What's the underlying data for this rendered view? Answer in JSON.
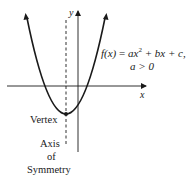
{
  "diagram": {
    "formula": {
      "lhs": "f(x)",
      "equals": " = ",
      "a_term": "ax",
      "exponent": "2",
      "rest": " + bx + c,",
      "condition": "a > 0"
    },
    "axes": {
      "x_label": "x",
      "y_label": "y"
    },
    "labels": {
      "vertex": "Vertex",
      "axis_line1": "Axis",
      "axis_line2": "of",
      "axis_line3": "Symmetry"
    },
    "colors": {
      "stroke": "#1a1a1a",
      "background": "#ffffff"
    }
  }
}
